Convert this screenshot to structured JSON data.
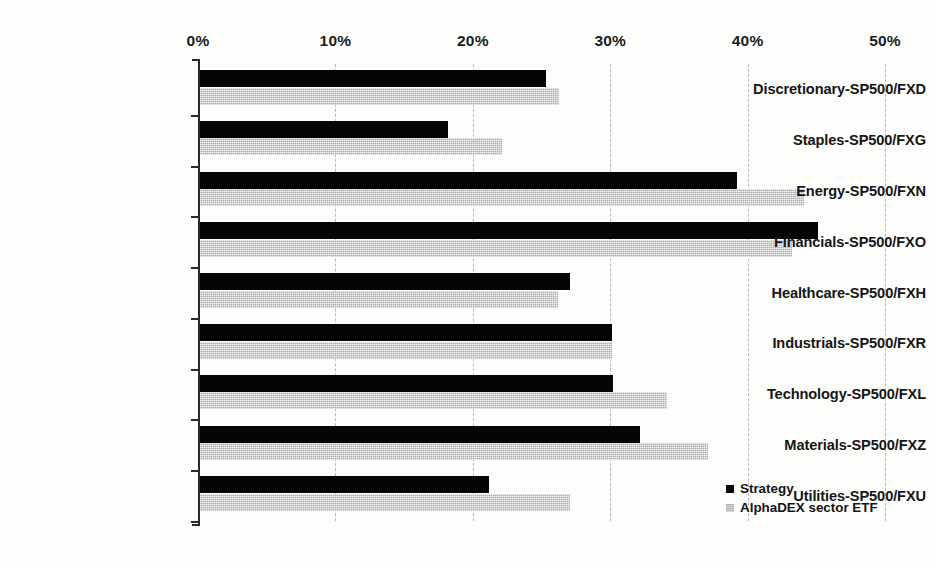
{
  "chart_data": {
    "type": "bar",
    "orientation": "horizontal",
    "title": "",
    "xlabel": "",
    "ylabel": "",
    "xlim": [
      0,
      50
    ],
    "xticks": [
      "0%",
      "10%",
      "20%",
      "30%",
      "40%",
      "50%"
    ],
    "xtick_values": [
      0,
      10,
      20,
      30,
      40,
      50
    ],
    "grid": "vertical-dashed",
    "legend_position": "bottom-right",
    "categories": [
      "Discretionary-SP500/FXD",
      "Staples-SP500/FXG",
      "Energy-SP500/FXN",
      "Financials-SP500/FXO",
      "Healthcare-SP500/FXH",
      "Industrials-SP500/FXR",
      "Technology-SP500/FXL",
      "Materials-SP500/FXZ",
      "Utilities-SP500/FXU"
    ],
    "series": [
      {
        "name": "Strategy",
        "color": "#050505",
        "values": [
          25.3,
          18.2,
          39.2,
          45.1,
          27.1,
          30.1,
          30.2,
          32.2,
          21.2
        ]
      },
      {
        "name": "AlphaDEX sector ETF",
        "color": "#adadad",
        "values": [
          26.3,
          22.1,
          44.1,
          43.2,
          26.2,
          30.1,
          34.1,
          37.1,
          27.1
        ]
      }
    ]
  },
  "legend": {
    "items": [
      {
        "label": "Strategy"
      },
      {
        "label": "AlphaDEX sector ETF"
      }
    ]
  }
}
